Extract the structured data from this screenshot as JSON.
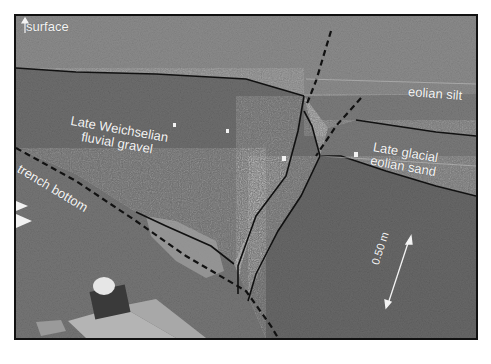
{
  "figure": {
    "type": "annotated-photograph",
    "labels": {
      "surface": "surface",
      "eolian_silt": "eolian silt",
      "fluvial_gravel_line1": "Late Weichselian",
      "fluvial_gravel_line2": "fluvial gravel",
      "eolian_sand_line1": "Late glacial",
      "eolian_sand_line2": "eolian sand",
      "trench_bottom": "trench bottom",
      "scale_bar": "0.50 m"
    },
    "colors": {
      "border": "#111111",
      "boundary_line": "#111111",
      "label_text": "#f4f4f4",
      "background": "#ffffff"
    }
  }
}
